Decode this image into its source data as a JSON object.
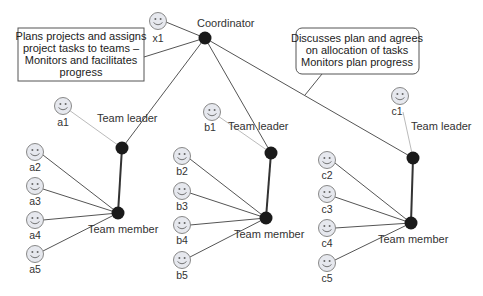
{
  "diagram": {
    "coordinator": {
      "label": "Coordinator",
      "person": "x1",
      "note_lines": [
        "Plans projects and assigns",
        "project tasks to teams –",
        "Monitors and facilitates",
        "progress"
      ]
    },
    "team_leader_note_lines": [
      "Discusses plan and agrees",
      "on allocation of tasks",
      "Monitors plan progress"
    ],
    "teams": [
      {
        "leader_label": "Team leader",
        "member_label": "Team member",
        "leader": "a1",
        "members": [
          "a2",
          "a3",
          "a4",
          "a5"
        ]
      },
      {
        "leader_label": "Team leader",
        "member_label": "Team member",
        "leader": "b1",
        "members": [
          "b2",
          "b3",
          "b4",
          "b5"
        ]
      },
      {
        "leader_label": "Team leader",
        "member_label": "Team member",
        "leader": "c1",
        "members": [
          "c2",
          "c3",
          "c4",
          "c5"
        ]
      }
    ],
    "colors": {
      "node": "#1a1a1a",
      "line": "#555555",
      "leader_link": "#bbbbbb",
      "face_fill": "#e6e8ee",
      "face_stroke": "#888888"
    }
  }
}
